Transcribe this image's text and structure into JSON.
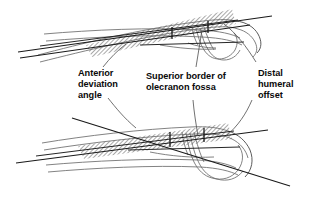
{
  "figure": {
    "labels": [
      {
        "id": "anterior-deviation-angle",
        "lines": [
          "Anterior",
          "deviation",
          "angle"
        ],
        "x": 78,
        "y": 76
      },
      {
        "id": "superior-border-olecranon-fossa",
        "lines": [
          "Superior border of",
          "olecranon fossa"
        ],
        "x": 146,
        "y": 79
      },
      {
        "id": "distal-humeral-offset",
        "lines": [
          "Distal",
          "humeral",
          "offset"
        ],
        "x": 258,
        "y": 76
      }
    ],
    "colors": {
      "ink": "#1a1a1a",
      "bone_outline": "#6b6b6b",
      "hatch": "#555555",
      "background": "#ffffff"
    },
    "annotations": {
      "upper_view": "Upper distal humerus tracing with hatched shaft band, reference axis lines and offset tick marks",
      "lower_view": "Lower distal humerus tracing with hatched shaft band, reference axis lines and offset tick marks"
    }
  }
}
